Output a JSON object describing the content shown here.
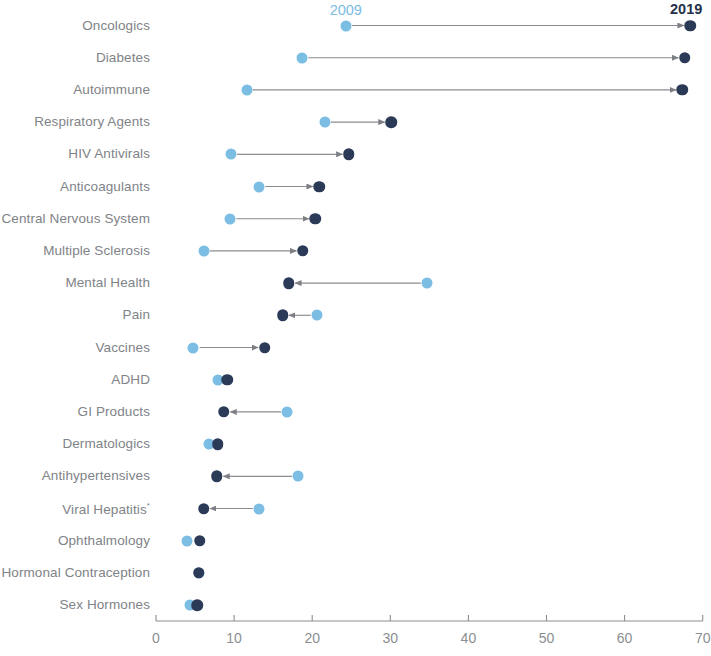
{
  "legend": {
    "start_label": "2009",
    "start_color": "#7cbde4",
    "end_label": "2019",
    "end_color": "#2b3a57"
  },
  "axis": {
    "ticks": [
      "0",
      "10",
      "20",
      "30",
      "40",
      "50",
      "60",
      "70"
    ],
    "min": 0,
    "max": 70,
    "step": 10
  },
  "chart_data": {
    "type": "dumbbell",
    "title": "",
    "subtitle": "",
    "xlabel": "",
    "ylabel": "",
    "xlim": [
      0,
      70
    ],
    "grid": false,
    "legend_position": "top",
    "categories": [
      "Oncologics",
      "Diabetes",
      "Autoimmune",
      "Respiratory Agents",
      "HIV Antivirals",
      "Anticoagulants",
      "Central Nervous System",
      "Multiple Sclerosis",
      "Mental Health",
      "Pain",
      "Vaccines",
      "ADHD",
      "GI Products",
      "Dermatologics",
      "Antihypertensives",
      "Viral Hepatitis",
      "Ophthalmology",
      "Hormonal Contraception",
      "Sex Hormones"
    ],
    "series": [
      {
        "name": "2009",
        "values": [
          24.3,
          18.7,
          11.6,
          21.6,
          9.6,
          13.2,
          9.5,
          6.1,
          34.7,
          20.6,
          4.8,
          7.9,
          16.8,
          6.8,
          18.2,
          13.2,
          4.0,
          5.5,
          4.3
        ]
      },
      {
        "name": "2019",
        "values": [
          68.4,
          67.7,
          67.4,
          30.1,
          24.7,
          20.9,
          20.4,
          18.8,
          17.0,
          16.2,
          13.9,
          9.1,
          8.7,
          7.9,
          7.8,
          6.1,
          5.6,
          5.5,
          5.3
        ]
      }
    ],
    "row_notes": [
      {
        "category": "Central Nervous System",
        "label_clipped": true,
        "visible_text": "ntral Nervous System"
      },
      {
        "category": "Hormonal Contraception",
        "label_clipped": true,
        "visible_text": "monal Contraception"
      },
      {
        "category": "Viral Hepatitis",
        "superscript": "*"
      }
    ]
  }
}
